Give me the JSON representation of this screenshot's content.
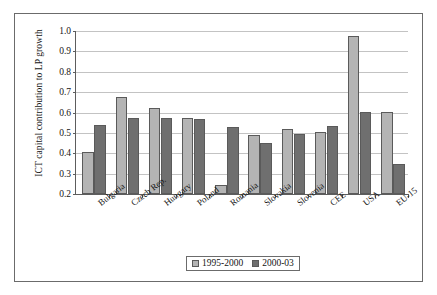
{
  "chart_data": {
    "type": "bar",
    "title": "",
    "xlabel": "",
    "ylabel": "ICT capital contribution to LP growth",
    "ylim": [
      0.2,
      1.0
    ],
    "ytick_step": 0.1,
    "yticks": [
      "1.0",
      "0.9",
      "0.8",
      "0.7",
      "0.6",
      "0.5",
      "0.4",
      "0.3",
      "0.2"
    ],
    "grid": true,
    "legend_position": "bottom-center",
    "categories": [
      "Bulgaria",
      "Czech Rep.",
      "Hungary",
      "Poland",
      "Romania",
      "Slovakia",
      "Slovenia",
      "CEE",
      "USA",
      "EU-15"
    ],
    "series": [
      {
        "name": "1995-2000",
        "color": "#b4b4b4",
        "values": [
          0.405,
          0.675,
          0.62,
          0.572,
          0.245,
          0.488,
          0.52,
          0.502,
          0.975,
          0.603
        ]
      },
      {
        "name": "2000-03",
        "color": "#6f6f6f",
        "values": [
          0.538,
          0.573,
          0.575,
          0.567,
          0.528,
          0.452,
          0.497,
          0.533,
          0.603,
          0.345
        ]
      }
    ]
  },
  "legend": {
    "items": [
      {
        "label": "1995-2000"
      },
      {
        "label": "2000-03"
      }
    ]
  }
}
